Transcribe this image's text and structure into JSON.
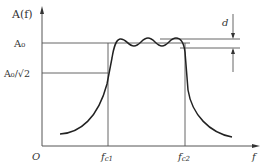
{
  "figure": {
    "y_axis_label": "A(f)",
    "x_axis_label": "f",
    "origin_label": "O",
    "level_A0": "A₀",
    "level_A0_sqrt2": "A₀/√2",
    "fc1_label": "f",
    "fc1_sub": "c1",
    "fc2_label": "f",
    "fc2_sub": "c2",
    "ripple_label": "d",
    "colors": {
      "line": "#333333",
      "curve": "#222222",
      "background": "#ffffff"
    }
  }
}
